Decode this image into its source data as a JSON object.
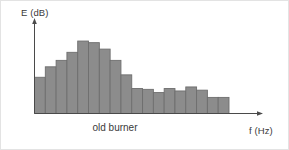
{
  "figure": {
    "caption": "old burner",
    "background_color": "#ffffff",
    "border_color": "#e3e3e3"
  },
  "axes": {
    "y_label": "E (dB)",
    "x_label": "f (Hz)",
    "axis_color": "#4a4a4a",
    "y_arrow": "up-arrow-icon",
    "x_arrow": "right-arrow-icon"
  },
  "chart_data": {
    "type": "bar",
    "title": "old burner",
    "xlabel": "f (Hz)",
    "ylabel": "E (dB)",
    "grid": false,
    "legend": null,
    "xlim": [
      0,
      18
    ],
    "ylim": [
      0,
      100
    ],
    "bar_fill_color": "#8c8c8c",
    "bar_edge_color": "#6e6e6e",
    "categories": [
      "1",
      "2",
      "3",
      "4",
      "5",
      "6",
      "7",
      "8",
      "9",
      "10",
      "11",
      "12",
      "13",
      "14",
      "15",
      "16",
      "17",
      "18"
    ],
    "values": [
      45,
      58,
      66,
      76,
      90,
      88,
      80,
      66,
      48,
      31,
      30,
      26,
      31,
      28,
      33,
      29,
      20,
      20
    ],
    "annotations": []
  }
}
